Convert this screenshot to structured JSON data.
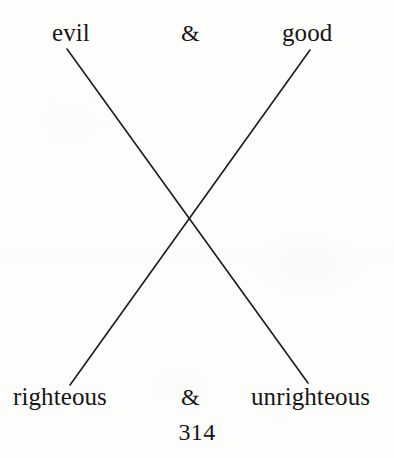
{
  "figure": {
    "type": "chiasmus-crossing-diagram",
    "top_row": {
      "left_label": "evil",
      "conjunction": "&",
      "right_label": "good"
    },
    "bottom_row": {
      "left_label": "righteous",
      "conjunction": "&",
      "right_label": "unrighteous"
    },
    "lines": [
      {
        "name": "evil-to-unrighteous",
        "from_label": "evil",
        "to_label": "unrighteous",
        "x1": 67,
        "y1": 49,
        "x2": 308,
        "y2": 383
      },
      {
        "name": "good-to-righteous",
        "from_label": "good",
        "to_label": "righteous",
        "x1": 310,
        "y1": 50,
        "x2": 70,
        "y2": 385
      }
    ],
    "crossing_point": {
      "x": 189,
      "y": 217
    },
    "stroke_color": "#1b1b1b",
    "stroke_width": 1.6
  },
  "folio": {
    "page_number": "314"
  },
  "colors": {
    "ink": "#161616",
    "paper": "#fdfdfc",
    "rule": "#1b1b1b"
  }
}
